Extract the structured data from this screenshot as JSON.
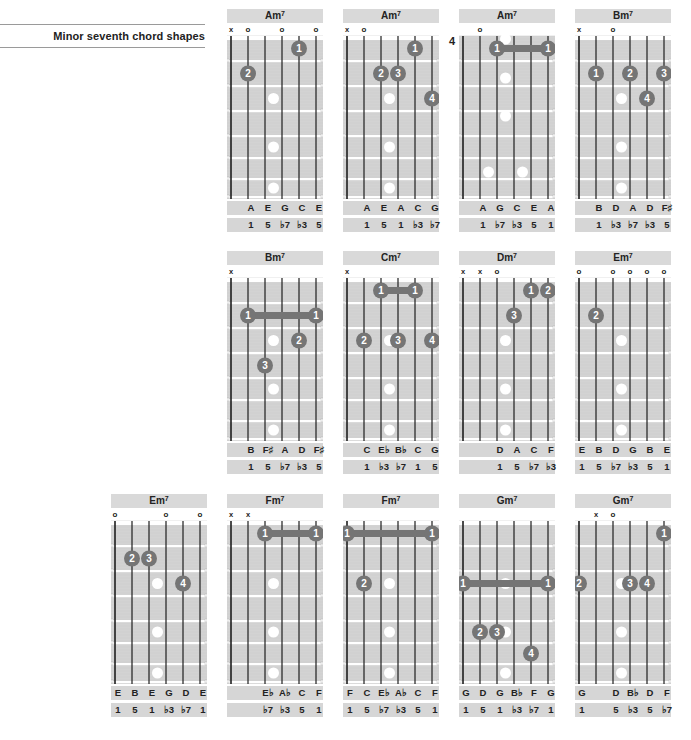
{
  "page": {
    "heading": "Minor seventh chord shapes"
  },
  "colors": {
    "board": "#d3d3d3",
    "fret": "#ffffff",
    "string": "#1e1e1e",
    "finger": "#757575",
    "finger_text": "#ffffff",
    "inlay": "#ffffff",
    "label_bg": "#d9d9d9"
  },
  "chords": [
    {
      "id": "am7-1",
      "name": "Am",
      "ext": "7",
      "col": 1,
      "row": 0,
      "start_fret": null,
      "markers": [
        "x",
        "o",
        "",
        "o",
        "",
        "o"
      ],
      "fingers": [
        {
          "string": 5,
          "fret": 1,
          "label": "1"
        },
        {
          "string": 2,
          "fret": 2,
          "label": "2"
        }
      ],
      "barres": [],
      "notes": [
        "",
        "A",
        "E",
        "G",
        "C",
        "E"
      ],
      "intervals": [
        "",
        "1",
        "5",
        "♭7",
        "♭3",
        "5"
      ]
    },
    {
      "id": "am7-2",
      "name": "Am",
      "ext": "7",
      "col": 2,
      "row": 0,
      "start_fret": null,
      "markers": [
        "x",
        "o",
        "",
        "",
        "",
        ""
      ],
      "fingers": [
        {
          "string": 5,
          "fret": 1,
          "label": "1"
        },
        {
          "string": 3,
          "fret": 2,
          "label": "2"
        },
        {
          "string": 4,
          "fret": 2,
          "label": "3"
        },
        {
          "string": 6,
          "fret": 3,
          "label": "4"
        }
      ],
      "barres": [],
      "notes": [
        "",
        "A",
        "E",
        "A",
        "C",
        "G"
      ],
      "intervals": [
        "",
        "1",
        "5",
        "1",
        "♭3",
        "♭7"
      ]
    },
    {
      "id": "am7-3",
      "name": "Am",
      "ext": "7",
      "col": 3,
      "row": 0,
      "start_fret": "4",
      "markers": [
        "",
        "o",
        "",
        "",
        "",
        ""
      ],
      "fingers": [],
      "barres": [
        {
          "from": 3,
          "to": 6,
          "fret": 1,
          "label": "1"
        }
      ],
      "notes": [
        "",
        "A",
        "G",
        "C",
        "E",
        "A"
      ],
      "intervals": [
        "",
        "1",
        "♭7",
        "♭3",
        "5",
        "1"
      ]
    },
    {
      "id": "bm7-1",
      "name": "Bm",
      "ext": "7",
      "col": 4,
      "row": 0,
      "start_fret": null,
      "markers": [
        "x",
        "",
        "o",
        "",
        "",
        ""
      ],
      "fingers": [
        {
          "string": 2,
          "fret": 2,
          "label": "1"
        },
        {
          "string": 4,
          "fret": 2,
          "label": "2"
        },
        {
          "string": 6,
          "fret": 2,
          "label": "3"
        },
        {
          "string": 5,
          "fret": 3,
          "label": "4"
        }
      ],
      "barres": [],
      "notes": [
        "",
        "B",
        "D",
        "A",
        "D",
        "F♯"
      ],
      "intervals": [
        "",
        "1",
        "♭3",
        "♭7",
        "♭3",
        "5"
      ]
    },
    {
      "id": "bm7-2",
      "name": "Bm",
      "ext": "7",
      "col": 1,
      "row": 1,
      "start_fret": null,
      "markers": [
        "x",
        "",
        "",
        "",
        "",
        ""
      ],
      "fingers": [
        {
          "string": 5,
          "fret": 3,
          "label": "2"
        },
        {
          "string": 3,
          "fret": 4,
          "label": "3"
        }
      ],
      "barres": [
        {
          "from": 2,
          "to": 6,
          "fret": 2,
          "label": "1"
        }
      ],
      "notes": [
        "",
        "B",
        "F♯",
        "A",
        "D",
        "F♯"
      ],
      "intervals": [
        "",
        "1",
        "5",
        "♭7",
        "♭3",
        "5"
      ]
    },
    {
      "id": "cm7",
      "name": "Cm",
      "ext": "7",
      "col": 2,
      "row": 1,
      "start_fret": null,
      "markers": [
        "x",
        "",
        "",
        "",
        "",
        ""
      ],
      "fingers": [
        {
          "string": 2,
          "fret": 3,
          "label": "2"
        },
        {
          "string": 4,
          "fret": 3,
          "label": "3"
        },
        {
          "string": 6,
          "fret": 3,
          "label": "4"
        }
      ],
      "barres": [
        {
          "from": 3,
          "to": 5,
          "fret": 1,
          "label": "1"
        }
      ],
      "notes": [
        "",
        "C",
        "E♭",
        "B♭",
        "C",
        "G"
      ],
      "intervals": [
        "",
        "1",
        "♭3",
        "♭7",
        "1",
        "5"
      ]
    },
    {
      "id": "dm7",
      "name": "Dm",
      "ext": "7",
      "col": 3,
      "row": 1,
      "start_fret": null,
      "markers": [
        "x",
        "x",
        "o",
        "",
        "",
        ""
      ],
      "fingers": [
        {
          "string": 5,
          "fret": 1,
          "label": "1"
        },
        {
          "string": 6,
          "fret": 1,
          "label": "2"
        },
        {
          "string": 4,
          "fret": 2,
          "label": "3"
        }
      ],
      "barres": [],
      "notes": [
        "",
        "",
        "D",
        "A",
        "C",
        "F"
      ],
      "intervals": [
        "",
        "",
        "1",
        "5",
        "♭7",
        "♭3"
      ]
    },
    {
      "id": "em7-1",
      "name": "Em",
      "ext": "7",
      "col": 4,
      "row": 1,
      "start_fret": null,
      "markers": [
        "o",
        "",
        "o",
        "o",
        "o",
        "o"
      ],
      "fingers": [
        {
          "string": 2,
          "fret": 2,
          "label": "2"
        }
      ],
      "barres": [],
      "notes": [
        "E",
        "B",
        "D",
        "G",
        "B",
        "E"
      ],
      "intervals": [
        "1",
        "5",
        "♭7",
        "♭3",
        "5",
        "1"
      ]
    },
    {
      "id": "em7-2",
      "name": "Em",
      "ext": "7",
      "col": 0,
      "row": 2,
      "start_fret": null,
      "markers": [
        "o",
        "",
        "",
        "o",
        "",
        "o"
      ],
      "fingers": [
        {
          "string": 2,
          "fret": 2,
          "label": "2"
        },
        {
          "string": 3,
          "fret": 2,
          "label": "3"
        },
        {
          "string": 5,
          "fret": 3,
          "label": "4"
        }
      ],
      "barres": [],
      "notes": [
        "E",
        "B",
        "E",
        "G",
        "D",
        "E"
      ],
      "intervals": [
        "1",
        "5",
        "1",
        "♭3",
        "♭7",
        "1"
      ]
    },
    {
      "id": "fm7-1",
      "name": "Fm",
      "ext": "7",
      "col": 1,
      "row": 2,
      "start_fret": null,
      "markers": [
        "x",
        "x",
        "",
        "",
        "",
        ""
      ],
      "fingers": [],
      "barres": [
        {
          "from": 3,
          "to": 6,
          "fret": 1,
          "label": "1"
        }
      ],
      "notes": [
        "",
        "",
        "E♭",
        "A♭",
        "C",
        "F"
      ],
      "intervals": [
        "",
        "",
        "♭7",
        "♭3",
        "5",
        "1"
      ]
    },
    {
      "id": "fm7-2",
      "name": "Fm",
      "ext": "7",
      "col": 2,
      "row": 2,
      "start_fret": null,
      "markers": [
        "",
        "",
        "",
        "",
        "",
        ""
      ],
      "fingers": [
        {
          "string": 2,
          "fret": 3,
          "label": "2"
        }
      ],
      "barres": [
        {
          "from": 1,
          "to": 6,
          "fret": 1,
          "label": "1"
        }
      ],
      "notes": [
        "F",
        "C",
        "E♭",
        "A♭",
        "C",
        "F"
      ],
      "intervals": [
        "1",
        "5",
        "♭7",
        "♭3",
        "5",
        "1"
      ]
    },
    {
      "id": "gm7-1",
      "name": "Gm",
      "ext": "7",
      "col": 3,
      "row": 2,
      "start_fret": null,
      "markers": [
        "",
        "",
        "",
        "",
        "",
        ""
      ],
      "fingers": [
        {
          "string": 2,
          "fret": 5,
          "label": "2"
        },
        {
          "string": 3,
          "fret": 5,
          "label": "3"
        },
        {
          "string": 5,
          "fret": 6,
          "label": "4"
        }
      ],
      "barres": [
        {
          "from": 1,
          "to": 6,
          "fret": 3,
          "label": "1"
        }
      ],
      "notes": [
        "G",
        "D",
        "G",
        "B♭",
        "F",
        "G"
      ],
      "intervals": [
        "1",
        "5",
        "1",
        "♭3",
        "♭7",
        "1"
      ]
    },
    {
      "id": "gm7-2",
      "name": "Gm",
      "ext": "7",
      "col": 4,
      "row": 2,
      "start_fret": null,
      "markers": [
        "",
        "x",
        "o",
        "",
        "",
        ""
      ],
      "fingers": [
        {
          "string": 6,
          "fret": 1,
          "label": "1"
        },
        {
          "string": 1,
          "fret": 3,
          "label": "2"
        },
        {
          "string": 4,
          "fret": 3,
          "label": "3"
        },
        {
          "string": 5,
          "fret": 3,
          "label": "4"
        }
      ],
      "barres": [],
      "notes": [
        "G",
        "",
        "D",
        "B♭",
        "D",
        "F"
      ],
      "intervals": [
        "1",
        "",
        "5",
        "♭3",
        "5",
        "♭7"
      ]
    }
  ]
}
